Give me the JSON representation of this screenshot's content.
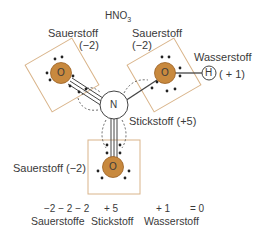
{
  "title": {
    "main": "HNO",
    "sub": "3"
  },
  "colors": {
    "oxygen_fill": "#c8893e",
    "oxygen_stroke": "#9a5f22",
    "box_stroke": "#d9b48a",
    "bond": "#444444"
  },
  "atoms": {
    "oxygen_symbol": "O",
    "nitrogen_symbol": "N",
    "hydrogen_symbol": "H"
  },
  "labels": {
    "oxygen_top_left": {
      "name": "Sauerstoff",
      "charge": "(−2)"
    },
    "oxygen_top_right": {
      "name": "Sauerstoff",
      "charge": "(−2)"
    },
    "hydrogen": {
      "name": "Wasserstoff",
      "charge": "( + 1)"
    },
    "nitrogen": "Stickstoff (+5)",
    "oxygen_bottom": "Sauerstoff (−2)"
  },
  "summary": {
    "values": [
      "−2 − 2 − 2",
      "+ 5",
      "+ 1",
      "= 0"
    ],
    "names": [
      "Sauerstoffe",
      "Stickstoff",
      "Wasserstoff"
    ]
  }
}
